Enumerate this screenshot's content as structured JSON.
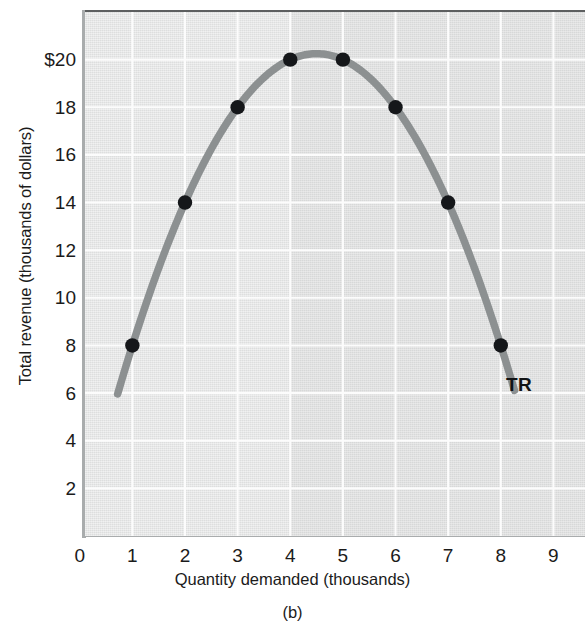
{
  "figure": {
    "caption": "(b)",
    "series_label": "TR"
  },
  "chart_data": {
    "type": "line",
    "title": "",
    "subtitle": "",
    "xlabel": "Quantity demanded (thousands)",
    "ylabel": "Total revenue (thousands of dollars)",
    "xlim": [
      0,
      9.6
    ],
    "ylim": [
      0,
      22
    ],
    "grid": true,
    "legend_position": "inline-right",
    "x_ticks": [
      "0",
      "1",
      "2",
      "3",
      "4",
      "5",
      "6",
      "7",
      "8",
      "9"
    ],
    "x_tick_values": [
      0,
      1,
      2,
      3,
      4,
      5,
      6,
      7,
      8,
      9
    ],
    "y_ticks": [
      "2",
      "4",
      "6",
      "8",
      "10",
      "12",
      "14",
      "16",
      "18",
      "$20"
    ],
    "y_tick_values": [
      2,
      4,
      6,
      8,
      10,
      12,
      14,
      16,
      18,
      20
    ],
    "series": [
      {
        "name": "TR",
        "annotation": "TR",
        "color": "#8c9091",
        "marker_color": "#15171a",
        "x": [
          1,
          2,
          3,
          4,
          5,
          6,
          7,
          8
        ],
        "values": [
          8,
          14,
          18,
          20,
          20,
          18,
          14,
          8
        ],
        "curve_x_start": 0.72,
        "curve_x_end": 8.26,
        "curve_y_start": 5.0,
        "curve_y_end": 5.1,
        "vertex_x": 4.5,
        "vertex_y": 20.25,
        "equation": "TR = 4.5*q*(9-q)/4.5"
      }
    ],
    "annotations": [
      {
        "text": "TR",
        "x": 8.1,
        "y": 6.4,
        "bold": true
      }
    ],
    "shaded_region": {
      "from_x": 4,
      "to_x": 9.6,
      "note": "slightly darker panel tint right of q=4"
    }
  }
}
